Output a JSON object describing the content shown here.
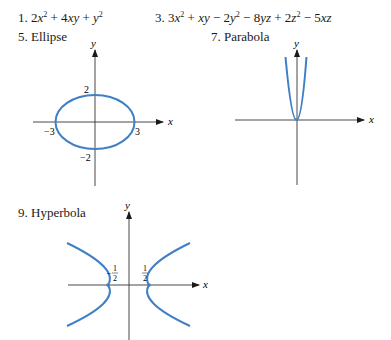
{
  "exercises": {
    "ex1": {
      "number": "1.",
      "expr": "2x² + 4xy + y²"
    },
    "ex3": {
      "number": "3.",
      "expr": "3x² + xy − 2y² − 8yz + 2z² − 5xz"
    },
    "ex5": {
      "number": "5.",
      "title": "Ellipse"
    },
    "ex7": {
      "number": "7.",
      "title": "Parabola"
    },
    "ex9": {
      "number": "9.",
      "title": "Hyperbola"
    }
  },
  "graphs": {
    "ellipse": {
      "x_axis": "x",
      "y_axis": "y",
      "ticks": {
        "left": "−3",
        "right": "3",
        "top": "2",
        "bottom": "−2"
      },
      "curve_color": "#3f7fc4"
    },
    "parabola": {
      "x_axis": "x",
      "y_axis": "y",
      "curve_color": "#3f7fc4"
    },
    "hyperbola": {
      "x_axis": "x",
      "y_axis": "y",
      "ticks": {
        "left_num": "1",
        "left_den": "2",
        "left_sign": "−",
        "right_num": "1",
        "right_den": "2"
      },
      "curve_color": "#3f7fc4"
    }
  }
}
